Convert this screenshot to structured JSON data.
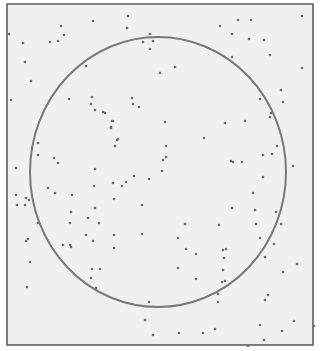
{
  "figure": {
    "background": "#f0f0f0",
    "frame": {
      "x": 7,
      "y": 4,
      "width": 306,
      "height": 341,
      "color": "#555555"
    },
    "circle": {
      "cx": 158,
      "cy": 172,
      "rx": 128,
      "ry": 135,
      "color": "#7a7a7a",
      "stroke_width": 2
    },
    "dot_color": "#6a6a6a",
    "dots": [
      [
        9,
        34
      ],
      [
        23,
        43
      ],
      [
        25,
        62
      ],
      [
        31,
        81
      ],
      [
        11,
        100
      ],
      [
        61,
        26
      ],
      [
        58,
        41
      ],
      [
        50,
        42
      ],
      [
        64,
        35
      ],
      [
        93,
        21
      ],
      [
        86,
        66
      ],
      [
        69,
        99
      ],
      [
        92,
        97
      ],
      [
        91,
        104
      ],
      [
        95,
        110
      ],
      [
        103,
        112
      ],
      [
        112,
        121
      ],
      [
        111,
        127
      ],
      [
        117,
        140
      ],
      [
        115,
        146
      ],
      [
        128,
        16
      ],
      [
        127,
        28
      ],
      [
        143,
        42
      ],
      [
        153,
        41
      ],
      [
        150,
        49
      ],
      [
        150,
        34
      ],
      [
        160,
        73
      ],
      [
        175,
        67
      ],
      [
        220,
        26
      ],
      [
        232,
        34
      ],
      [
        166,
        157
      ],
      [
        132,
        98
      ],
      [
        139,
        107
      ],
      [
        105,
        113
      ],
      [
        133,
        104
      ],
      [
        238,
        20
      ],
      [
        251,
        20
      ],
      [
        249,
        39
      ],
      [
        264,
        40
      ],
      [
        270,
        55
      ],
      [
        232,
        57
      ],
      [
        302,
        16
      ],
      [
        302,
        68
      ],
      [
        281,
        90
      ],
      [
        283,
        102
      ],
      [
        260,
        99
      ],
      [
        270,
        117
      ],
      [
        271,
        113
      ],
      [
        225,
        123
      ],
      [
        16,
        168
      ],
      [
        16,
        195
      ],
      [
        17,
        205
      ],
      [
        38,
        143
      ],
      [
        38,
        155
      ],
      [
        54,
        158
      ],
      [
        58,
        163
      ],
      [
        48,
        188
      ],
      [
        55,
        193
      ],
      [
        72,
        195
      ],
      [
        95,
        169
      ],
      [
        94,
        186
      ],
      [
        95,
        208
      ],
      [
        99,
        223
      ],
      [
        71,
        212
      ],
      [
        86,
        235
      ],
      [
        113,
        121
      ],
      [
        111,
        128
      ],
      [
        118,
        139
      ],
      [
        115,
        146
      ],
      [
        165,
        122
      ],
      [
        166,
        146
      ],
      [
        204,
        138
      ],
      [
        163,
        160
      ],
      [
        162,
        171
      ],
      [
        126,
        182
      ],
      [
        134,
        176
      ],
      [
        149,
        179
      ],
      [
        113,
        183
      ],
      [
        122,
        186
      ],
      [
        114,
        199
      ],
      [
        142,
        205
      ],
      [
        185,
        224
      ],
      [
        178,
        238
      ],
      [
        245,
        121
      ],
      [
        231,
        161
      ],
      [
        233,
        162
      ],
      [
        242,
        162
      ],
      [
        263,
        155
      ],
      [
        272,
        154
      ],
      [
        277,
        146
      ],
      [
        293,
        166
      ],
      [
        263,
        177
      ],
      [
        253,
        193
      ],
      [
        232,
        208
      ],
      [
        255,
        210
      ],
      [
        276,
        212
      ],
      [
        219,
        225
      ],
      [
        256,
        224
      ],
      [
        281,
        224
      ],
      [
        26,
        198
      ],
      [
        29,
        200
      ],
      [
        25,
        205
      ],
      [
        26,
        241
      ],
      [
        28,
        239
      ],
      [
        30,
        262
      ],
      [
        27,
        287
      ],
      [
        38,
        223
      ],
      [
        70,
        223
      ],
      [
        71,
        247
      ],
      [
        88,
        218
      ],
      [
        93,
        241
      ],
      [
        63,
        245
      ],
      [
        70,
        245
      ],
      [
        92,
        269
      ],
      [
        91,
        278
      ],
      [
        96,
        288
      ],
      [
        100,
        269
      ],
      [
        114,
        235
      ],
      [
        114,
        248
      ],
      [
        142,
        234
      ],
      [
        186,
        249
      ],
      [
        196,
        254
      ],
      [
        178,
        268
      ],
      [
        223,
        250
      ],
      [
        223,
        270
      ],
      [
        196,
        279
      ],
      [
        149,
        302
      ],
      [
        145,
        320
      ],
      [
        153,
        335
      ],
      [
        179,
        333
      ],
      [
        203,
        333
      ],
      [
        224,
        258
      ],
      [
        226,
        249
      ],
      [
        260,
        238
      ],
      [
        274,
        244
      ],
      [
        265,
        257
      ],
      [
        297,
        264
      ],
      [
        283,
        272
      ],
      [
        225,
        281
      ],
      [
        222,
        282
      ],
      [
        218,
        302
      ],
      [
        218,
        294
      ],
      [
        268,
        295
      ],
      [
        265,
        300
      ],
      [
        294,
        321
      ],
      [
        215,
        329
      ],
      [
        264,
        340
      ],
      [
        248,
        346
      ],
      [
        282,
        331
      ],
      [
        260,
        325
      ],
      [
        314,
        326
      ]
    ]
  }
}
